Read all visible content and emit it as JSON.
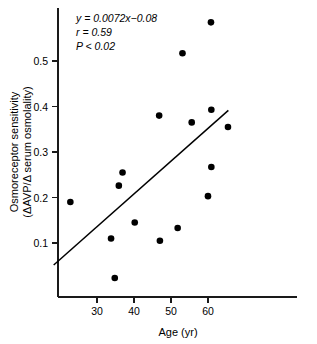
{
  "chart_data": {
    "type": "scatter",
    "title": "",
    "xlabel": "Age (yr)",
    "ylabel_line1": "Osmoreceptor sensitivity",
    "ylabel_line2": "(ΔAVP/Δ serum osmolality)",
    "xlim": [
      20,
      70
    ],
    "ylim": [
      0.0,
      0.6
    ],
    "xticks": [
      30,
      40,
      50,
      60
    ],
    "xtick_labels": [
      "30",
      "40",
      "50",
      "60"
    ],
    "yticks": [
      0.1,
      0.2,
      0.3,
      0.4,
      0.5
    ],
    "ytick_labels": [
      "0.1",
      "0.2",
      "0.3",
      "0.4",
      "0.5"
    ],
    "grid": false,
    "legend": "none",
    "marker_color": "#000000",
    "line_color": "#000000",
    "axis_color": "#1a1a1a",
    "x": [
      22.8,
      33.8,
      34.8,
      35.9,
      36.9,
      40.2,
      46.8,
      47.0,
      51.8,
      53.1,
      55.6,
      60.0,
      60.8,
      60.9,
      60.9,
      65.4
    ],
    "y": [
      0.19,
      0.11,
      0.023,
      0.226,
      0.255,
      0.145,
      0.38,
      0.105,
      0.133,
      0.517,
      0.365,
      0.203,
      0.585,
      0.393,
      0.267,
      0.355
    ],
    "points": [
      {
        "age": 22.8,
        "sensitivity": 0.19
      },
      {
        "age": 33.8,
        "sensitivity": 0.11
      },
      {
        "age": 34.8,
        "sensitivity": 0.023
      },
      {
        "age": 35.9,
        "sensitivity": 0.226
      },
      {
        "age": 36.9,
        "sensitivity": 0.255
      },
      {
        "age": 40.2,
        "sensitivity": 0.145
      },
      {
        "age": 46.8,
        "sensitivity": 0.38
      },
      {
        "age": 47.0,
        "sensitivity": 0.105
      },
      {
        "age": 51.8,
        "sensitivity": 0.133
      },
      {
        "age": 53.1,
        "sensitivity": 0.517
      },
      {
        "age": 55.6,
        "sensitivity": 0.365
      },
      {
        "age": 60.0,
        "sensitivity": 0.203
      },
      {
        "age": 60.8,
        "sensitivity": 0.585
      },
      {
        "age": 60.9,
        "sensitivity": 0.393
      },
      {
        "age": 60.9,
        "sensitivity": 0.267
      },
      {
        "age": 65.4,
        "sensitivity": 0.355
      }
    ],
    "fit_line": {
      "slope": 0.0072,
      "intercept": -0.08,
      "x_start": 18.3,
      "x_end": 65.5
    },
    "annotations": {
      "equation_var_y": "y",
      "equation_eq": " = 0.0072",
      "equation_var_x": "x",
      "equation_tail": "−0.08",
      "equation_full": "y = 0.0072x−0.08",
      "r_symbol": "r",
      "r_value": " = 0.59",
      "r_full": "r = 0.59",
      "p_symbol": "P",
      "p_value": " < 0.02",
      "p_full": "P < 0.02"
    }
  }
}
